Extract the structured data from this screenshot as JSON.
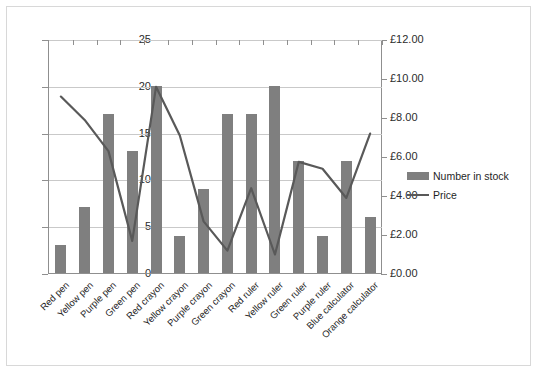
{
  "chart_data": {
    "type": "bar",
    "title": "",
    "xlabel": "",
    "ylabel": "",
    "grid": true,
    "legend_position": "right",
    "categories": [
      "Red pen",
      "Yellow pen",
      "Purple pen",
      "Green pen",
      "Red crayon",
      "Yellow crayon",
      "Purple crayon",
      "Green crayon",
      "Red ruler",
      "Yellow ruler",
      "Green ruler",
      "Purple ruler",
      "Blue calculator",
      "Orange calculator"
    ],
    "series": [
      {
        "name": "Number in stock",
        "type": "bar",
        "axis": "left",
        "color": "#7f7f7f",
        "values": [
          3,
          7,
          17,
          13,
          20,
          4,
          9,
          17,
          17,
          20,
          12,
          4,
          12,
          6
        ]
      },
      {
        "name": "Price",
        "type": "line",
        "axis": "right",
        "color": "#595959",
        "values": [
          9.1,
          7.9,
          6.3,
          1.7,
          9.6,
          7.1,
          2.7,
          1.2,
          4.4,
          1.0,
          5.75,
          5.4,
          3.9,
          7.2
        ]
      }
    ],
    "left_axis": {
      "label": "",
      "min": 0,
      "max": 25,
      "step": 5,
      "ticks": [
        "0",
        "5",
        "10",
        "15",
        "20",
        "25"
      ]
    },
    "right_axis": {
      "label": "",
      "min": 0,
      "max": 12,
      "step": 2,
      "ticks": [
        "£0.00",
        "£2.00",
        "£4.00",
        "£6.00",
        "£8.00",
        "£10.00",
        "£12.00"
      ]
    },
    "legend": [
      {
        "label": "Number in stock",
        "marker": "bar-swatch"
      },
      {
        "label": "Price",
        "marker": "line-swatch"
      }
    ]
  }
}
